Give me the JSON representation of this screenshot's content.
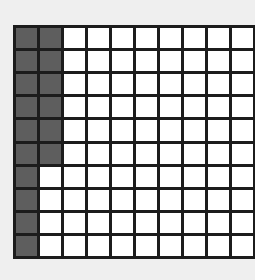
{
  "diagram": {
    "type": "hundred-grid",
    "rows": 10,
    "columns": 10,
    "total_cells": 100,
    "shaded_count": 16,
    "shaded_description": "First column fully shaded (10 cells); second column shaded for top 6 rows",
    "shaded_cells": [
      [
        0,
        0
      ],
      [
        1,
        0
      ],
      [
        2,
        0
      ],
      [
        3,
        0
      ],
      [
        4,
        0
      ],
      [
        5,
        0
      ],
      [
        6,
        0
      ],
      [
        7,
        0
      ],
      [
        8,
        0
      ],
      [
        9,
        0
      ],
      [
        0,
        1
      ],
      [
        1,
        1
      ],
      [
        2,
        1
      ],
      [
        3,
        1
      ],
      [
        4,
        1
      ],
      [
        5,
        1
      ]
    ],
    "colors": {
      "background": "#efefef",
      "grid_line": "#1c1c1c",
      "shaded": "#5e5e5e",
      "unshaded": "#ffffff"
    }
  }
}
